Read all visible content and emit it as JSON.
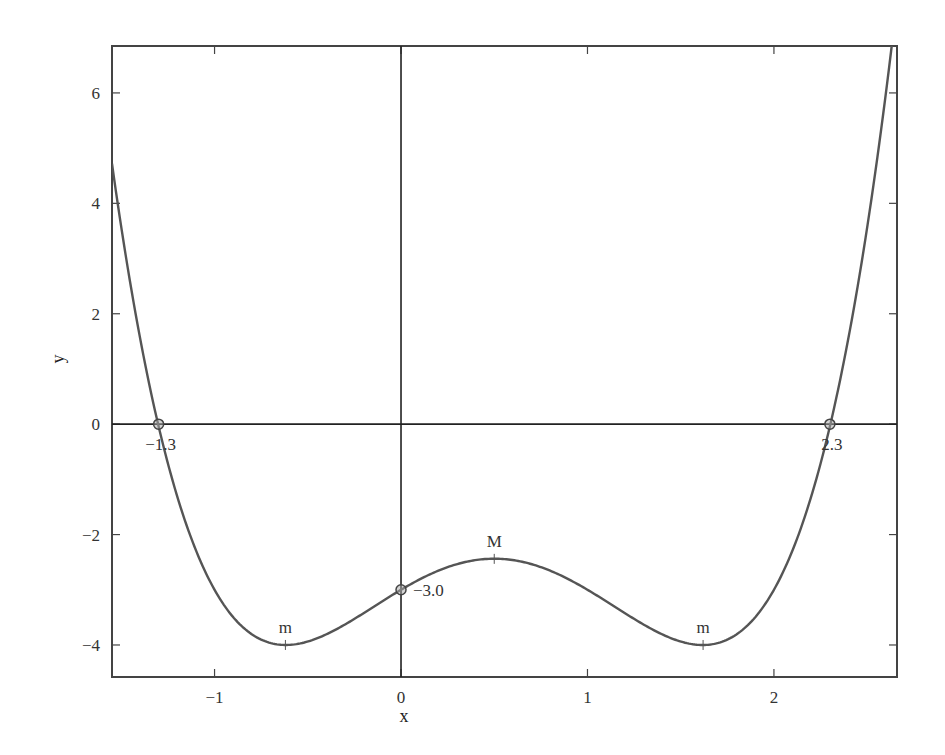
{
  "chart_data": {
    "type": "line",
    "title": "",
    "xlabel": "x",
    "ylabel": "y",
    "xlim": [
      -1.55,
      2.66
    ],
    "ylim": [
      -4.58,
      6.85
    ],
    "grid": false,
    "legend": null,
    "x_ticks": [
      -1,
      0,
      1,
      2
    ],
    "x_tick_labels": [
      "−1",
      "0",
      "1",
      "2"
    ],
    "y_ticks": [
      -4,
      -2,
      0,
      2,
      4,
      6
    ],
    "y_tick_labels": [
      "−4",
      "−2",
      "0",
      "2",
      "4",
      "6"
    ],
    "series": [
      {
        "name": "y = (x−0.5)^4 − 2.5(x−0.5)^2 − 2.4375",
        "color": "#555555",
        "function": {
          "a": 1,
          "b": 2.5,
          "c": -2.4375,
          "shift": 0.5
        },
        "x": [
          -1.55,
          -1.3,
          -1.0,
          -0.62,
          -0.3,
          0.0,
          0.25,
          0.5,
          0.75,
          1.0,
          1.3,
          1.62,
          2.0,
          2.3,
          2.6
        ],
        "y": [
          4.71,
          0.0,
          -2.99,
          -4.0,
          -3.62,
          -3.0,
          -2.59,
          -2.44,
          -2.59,
          -3.0,
          -3.63,
          -4.0,
          -2.98,
          0.0,
          5.0
        ]
      }
    ],
    "reference_lines": [
      {
        "orientation": "horizontal",
        "value": 0
      },
      {
        "orientation": "vertical",
        "value": 0
      }
    ],
    "annotations": [
      {
        "type": "point",
        "x": -1.3,
        "y": 0,
        "label": "−1.3"
      },
      {
        "type": "point",
        "x": 2.3,
        "y": 0,
        "label": "2.3"
      },
      {
        "type": "point",
        "x": 0,
        "y": -3.0,
        "label": "−3.0"
      },
      {
        "type": "text",
        "x": 0.5,
        "y": -2.44,
        "label": "M"
      },
      {
        "type": "text",
        "x": -0.62,
        "y": -4.0,
        "label": "m"
      },
      {
        "type": "text",
        "x": 1.62,
        "y": -4.0,
        "label": "m"
      }
    ]
  }
}
